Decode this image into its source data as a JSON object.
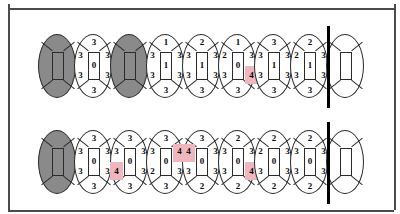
{
  "chart_data": {
    "type": "table",
    "legend": {
      "grey_tooth": "shaded / missing-or-restored tooth",
      "highlight_color": "#f0b6bd",
      "highlight_meaning": "pocket depth of 4 mm or greater"
    },
    "arches": [
      {
        "name": "upper-arch",
        "teeth": [
          {
            "id": "u1",
            "shaded": true,
            "top": "",
            "lt": "",
            "lb": "",
            "center": "",
            "rt": "",
            "rb": "",
            "bottom": "",
            "hl": []
          },
          {
            "id": "u2",
            "shaded": false,
            "top": "3",
            "lt": "3",
            "lb": "3",
            "center": "0",
            "rt": "3",
            "rb": "3",
            "bottom": "3",
            "hl": []
          },
          {
            "id": "u3",
            "shaded": true,
            "top": "",
            "lt": "",
            "lb": "",
            "center": "",
            "rt": "",
            "rb": "",
            "bottom": "",
            "hl": []
          },
          {
            "id": "u4",
            "shaded": false,
            "top": "1",
            "lt": "3",
            "lb": "3",
            "center": "1",
            "rt": "3",
            "rb": "3",
            "bottom": "3",
            "hl": []
          },
          {
            "id": "u5",
            "shaded": false,
            "top": "2",
            "lt": "3",
            "lb": "3",
            "center": "1",
            "rt": "3",
            "rb": "3",
            "bottom": "3",
            "hl": []
          },
          {
            "id": "u6",
            "shaded": false,
            "top": "1",
            "lt": "2",
            "lb": "3",
            "center": "0",
            "rt": "3",
            "rb": "4",
            "bottom": "3",
            "hl": [
              "rb"
            ]
          },
          {
            "id": "u7",
            "shaded": false,
            "top": "3",
            "lt": "3",
            "lb": "3",
            "center": "1",
            "rt": "3",
            "rb": "3",
            "bottom": "3",
            "hl": []
          },
          {
            "id": "u8",
            "shaded": false,
            "top": "2",
            "lt": "2",
            "lb": "3",
            "center": "1",
            "rt": "3",
            "rb": "3",
            "bottom": "3",
            "hl": []
          },
          {
            "id": "u9",
            "shaded": false,
            "top": "",
            "lt": "",
            "lb": "",
            "center": "",
            "rt": "",
            "rb": "",
            "bottom": "",
            "hl": []
          }
        ]
      },
      {
        "name": "lower-arch",
        "teeth": [
          {
            "id": "l1",
            "shaded": true,
            "top": "",
            "lt": "",
            "lb": "",
            "center": "",
            "rt": "",
            "rb": "",
            "bottom": "",
            "hl": []
          },
          {
            "id": "l2",
            "shaded": false,
            "top": "3",
            "lt": "3",
            "lb": "3",
            "center": "0",
            "rt": "3",
            "rb": "3",
            "bottom": "3",
            "hl": []
          },
          {
            "id": "l3",
            "shaded": false,
            "top": "3",
            "lt": "3",
            "lb": "4",
            "center": "0",
            "rt": "3",
            "rb": "3",
            "bottom": "3",
            "hl": [
              "lb"
            ]
          },
          {
            "id": "l4",
            "shaded": false,
            "top": "3",
            "lt": "3",
            "lb": "2",
            "center": "0",
            "rt": "4",
            "rb": "3",
            "bottom": "3",
            "hl": [
              "rt"
            ]
          },
          {
            "id": "l5",
            "shaded": false,
            "top": "3",
            "lt": "4",
            "lb": "3",
            "center": "0",
            "rt": "3",
            "rb": "3",
            "bottom": "2",
            "hl": [
              "lt"
            ]
          },
          {
            "id": "l6",
            "shaded": false,
            "top": "2",
            "lt": "3",
            "lb": "3",
            "center": "0",
            "rt": "3",
            "rb": "4",
            "bottom": "2",
            "hl": [
              "rb"
            ]
          },
          {
            "id": "l7",
            "shaded": false,
            "top": "2",
            "lt": "2",
            "lb": "3",
            "center": "0",
            "rt": "3",
            "rb": "3",
            "bottom": "2",
            "hl": []
          },
          {
            "id": "l8",
            "shaded": false,
            "top": "2",
            "lt": "3",
            "lb": "3",
            "center": "0",
            "rt": "3",
            "rb": "3",
            "bottom": "2",
            "hl": []
          },
          {
            "id": "l9",
            "shaded": false,
            "top": "",
            "lt": "",
            "lb": "",
            "center": "",
            "rt": "",
            "rb": "",
            "bottom": "",
            "hl": []
          }
        ]
      }
    ]
  }
}
